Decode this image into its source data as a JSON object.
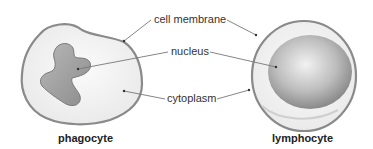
{
  "diagram": {
    "labels": {
      "cell_membrane": "cell membrane",
      "nucleus": "nucleus",
      "cytoplasm": "cytoplasm"
    },
    "cells": [
      {
        "name": "phagocyte"
      },
      {
        "name": "lymphocyte"
      }
    ],
    "colors": {
      "membrane": "#8a8a8a",
      "cytoplasm": "#f4f4f4",
      "nucleus_light": "#d8d8d8",
      "nucleus_dark": "#8f8f8f",
      "leader_line": "#777777"
    }
  }
}
